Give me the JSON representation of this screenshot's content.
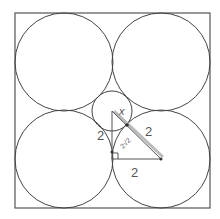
{
  "diagram": {
    "type": "geometry",
    "colors": {
      "stroke": "#444444",
      "label": "#555555",
      "hypotenuse_highlight": "#aaaaaa",
      "background": "#ffffff"
    },
    "square": {
      "x": 15,
      "y": 13,
      "size": 195
    },
    "large_circles": [
      {
        "id": "top-left",
        "cx": 64,
        "cy": 62,
        "r": 49
      },
      {
        "id": "top-right",
        "cx": 161,
        "cy": 62,
        "r": 49
      },
      {
        "id": "bottom-left",
        "cx": 64,
        "cy": 159,
        "r": 49
      },
      {
        "id": "bottom-right",
        "cx": 161,
        "cy": 159,
        "r": 49
      }
    ],
    "small_circle": {
      "cx": 112,
      "cy": 111,
      "r": 20
    },
    "triangle": {
      "vertices": [
        [
          112,
          111
        ],
        [
          112,
          159
        ],
        [
          161,
          159
        ]
      ],
      "right_angle_at": [
        112,
        159
      ]
    },
    "labels": {
      "x": "x",
      "left_leg": "2",
      "radius_segment": "2",
      "bottom_leg": "2",
      "hypotenuse": "2√2"
    }
  }
}
